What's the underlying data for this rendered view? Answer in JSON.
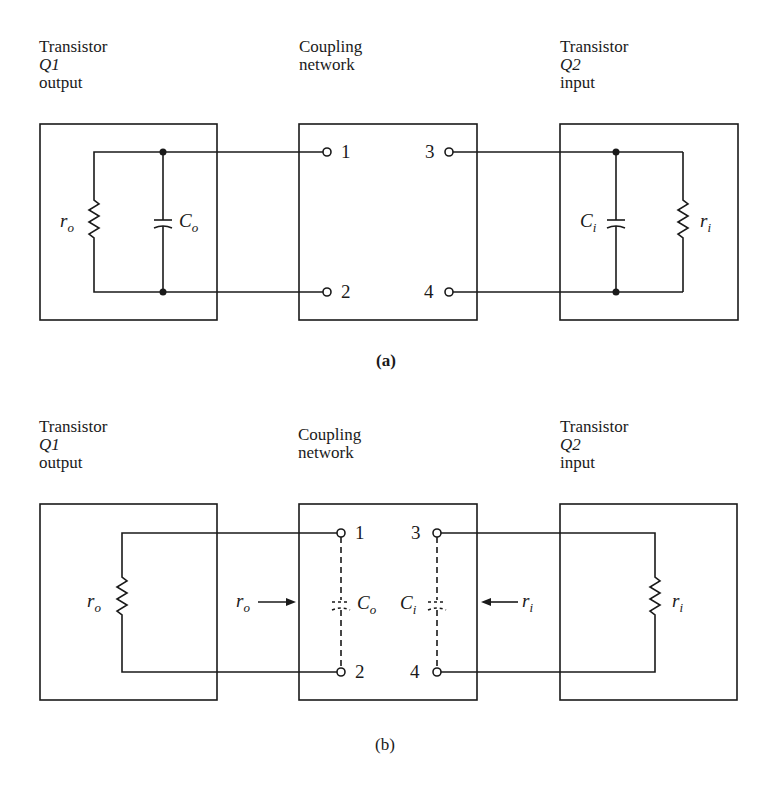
{
  "panels": {
    "a": {
      "caption": "(a)",
      "q1": {
        "line1": "Transistor",
        "line2": "Q1",
        "line3": "output"
      },
      "coupling": {
        "line1": "Coupling",
        "line2": "network"
      },
      "q2": {
        "line1": "Transistor",
        "line2": "Q2",
        "line3": "input"
      },
      "components": {
        "ro_sym": "r",
        "ro_sub": "o",
        "co_sym": "C",
        "co_sub": "o",
        "ci_sym": "C",
        "ci_sub": "i",
        "ri_sym": "r",
        "ri_sub": "i"
      },
      "terminals": [
        "1",
        "2",
        "3",
        "4"
      ]
    },
    "b": {
      "caption": "(b)",
      "q1": {
        "line1": "Transistor",
        "line2": "Q1",
        "line3": "output"
      },
      "coupling": {
        "line1": "Coupling",
        "line2": "network"
      },
      "q2": {
        "line1": "Transistor",
        "line2": "Q2",
        "line3": "input"
      },
      "components": {
        "ro_sym": "r",
        "ro_sub": "o",
        "ro_arrow_sym": "r",
        "ro_arrow_sub": "o",
        "co_sym": "C",
        "co_sub": "o",
        "ci_sym": "C",
        "ci_sub": "i",
        "ri_arrow_sym": "r",
        "ri_arrow_sub": "i",
        "ri_sym": "r",
        "ri_sub": "i"
      },
      "terminals": [
        "1",
        "2",
        "3",
        "4"
      ]
    }
  },
  "colors": {
    "ink": "#1a1a1a",
    "background": "#ffffff"
  }
}
